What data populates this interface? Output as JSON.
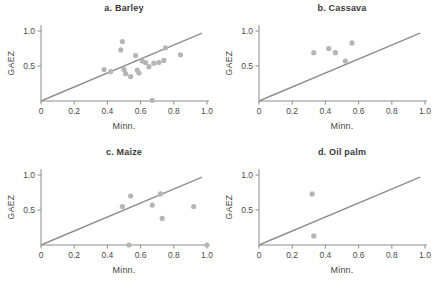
{
  "figure": {
    "background": "#ffffff",
    "style": {
      "point_color": "#b5b5b5",
      "line_color": "#8f8f8f",
      "axis_color": "#8a8a8a",
      "tick_text_color": "#4a4a4a",
      "title_color": "#3a3a3a"
    }
  },
  "chart_data": [
    {
      "type": "scatter",
      "title": "a. Barley",
      "xlabel": "Minn.",
      "ylabel": "GAEZ",
      "xlim": [
        0,
        1.0
      ],
      "ylim": [
        0,
        1.0
      ],
      "grid": false,
      "xticks": [
        0,
        0.2,
        0.4,
        0.6,
        0.8,
        1.0
      ],
      "xtick_labels": [
        "0",
        "0.2",
        "0.4",
        "0.6",
        "0.8",
        "1.0"
      ],
      "yticks": [
        0.5,
        1.0
      ],
      "ytick_labels": [
        "0.5",
        "1.0"
      ],
      "identity_line": {
        "x1": 0,
        "y1": 0,
        "x2": 0.97,
        "y2": 0.97
      },
      "points": [
        [
          0.38,
          0.45
        ],
        [
          0.42,
          0.42
        ],
        [
          0.48,
          0.73
        ],
        [
          0.49,
          0.85
        ],
        [
          0.5,
          0.45
        ],
        [
          0.51,
          0.39
        ],
        [
          0.54,
          0.35
        ],
        [
          0.57,
          0.65
        ],
        [
          0.58,
          0.44
        ],
        [
          0.59,
          0.4
        ],
        [
          0.61,
          0.57
        ],
        [
          0.63,
          0.55
        ],
        [
          0.65,
          0.49
        ],
        [
          0.67,
          0.01
        ],
        [
          0.68,
          0.54
        ],
        [
          0.71,
          0.55
        ],
        [
          0.74,
          0.58
        ],
        [
          0.75,
          0.76
        ],
        [
          0.84,
          0.66
        ]
      ]
    },
    {
      "type": "scatter",
      "title": "b. Cassava",
      "xlabel": "Minn.",
      "ylabel": "GAEZ",
      "xlim": [
        0,
        1.0
      ],
      "ylim": [
        0,
        1.0
      ],
      "grid": false,
      "xticks": [
        0,
        0.2,
        0.4,
        0.6,
        0.8,
        1.0
      ],
      "xtick_labels": [
        "0",
        "0.2",
        "0.4",
        "0.6",
        "0.8",
        "1.0"
      ],
      "yticks": [
        0.5,
        1.0
      ],
      "ytick_labels": [
        "0.5",
        "1.0"
      ],
      "identity_line": {
        "x1": 0,
        "y1": 0,
        "x2": 0.97,
        "y2": 0.97
      },
      "points": [
        [
          0.33,
          0.69
        ],
        [
          0.42,
          0.75
        ],
        [
          0.46,
          0.69
        ],
        [
          0.52,
          0.57
        ],
        [
          0.56,
          0.83
        ]
      ]
    },
    {
      "type": "scatter",
      "title": "c. Maize",
      "xlabel": "Minn.",
      "ylabel": "GAEZ",
      "xlim": [
        0,
        1.0
      ],
      "ylim": [
        0,
        1.0
      ],
      "grid": false,
      "xticks": [
        0,
        0.2,
        0.4,
        0.6,
        0.8,
        1.0
      ],
      "xtick_labels": [
        "0",
        "0.2",
        "0.4",
        "0.6",
        "0.8",
        "1.0"
      ],
      "yticks": [
        0.5,
        1.0
      ],
      "ytick_labels": [
        "0.5",
        "1.0"
      ],
      "identity_line": {
        "x1": 0,
        "y1": 0,
        "x2": 0.97,
        "y2": 0.97
      },
      "points": [
        [
          0.49,
          0.55
        ],
        [
          0.53,
          0.0
        ],
        [
          0.54,
          0.7
        ],
        [
          0.67,
          0.57
        ],
        [
          0.72,
          0.73
        ],
        [
          0.73,
          0.38
        ],
        [
          0.92,
          0.55
        ],
        [
          1.0,
          0.0
        ]
      ]
    },
    {
      "type": "scatter",
      "title": "d. Oil palm",
      "xlabel": "Minn.",
      "ylabel": "GAEZ",
      "xlim": [
        0,
        1.0
      ],
      "ylim": [
        0,
        1.0
      ],
      "grid": false,
      "xticks": [
        0,
        0.2,
        0.4,
        0.6,
        0.8,
        1.0
      ],
      "xtick_labels": [
        "0",
        "0.2",
        "0.4",
        "0.6",
        "0.8",
        "1.0"
      ],
      "yticks": [
        0.5,
        1.0
      ],
      "ytick_labels": [
        "0.5",
        "1.0"
      ],
      "identity_line": {
        "x1": 0,
        "y1": 0,
        "x2": 0.97,
        "y2": 0.97
      },
      "points": [
        [
          0.32,
          0.73
        ],
        [
          0.33,
          0.13
        ]
      ]
    }
  ]
}
